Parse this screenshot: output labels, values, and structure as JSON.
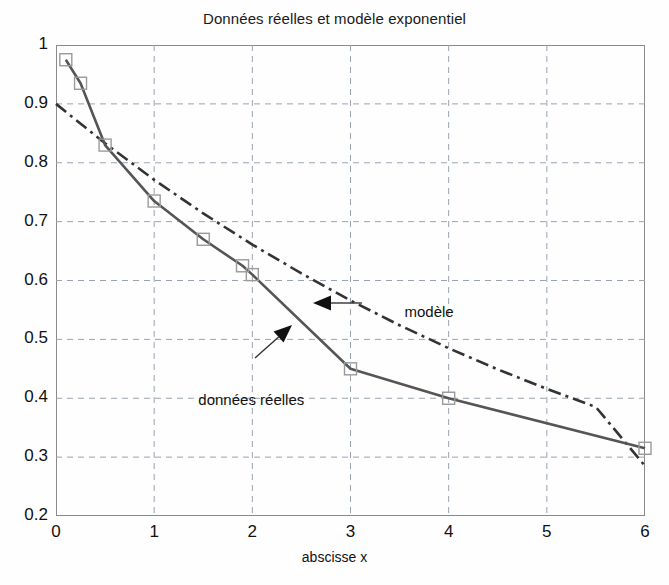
{
  "chart_data": {
    "type": "line",
    "title": "Données réelles et modèle exponentiel",
    "xlabel": "abscisse x",
    "ylabel": "",
    "xlim": [
      0,
      6
    ],
    "ylim": [
      0.2,
      1.0
    ],
    "xticks": [
      "0",
      "1",
      "2",
      "3",
      "4",
      "5",
      "6"
    ],
    "yticks": [
      "0.2",
      "0.3",
      "0.4",
      "0.5",
      "0.6",
      "0.7",
      "0.8",
      "0.9",
      "1"
    ],
    "grid": true,
    "grid_style": "dashed",
    "legend": "none",
    "series": [
      {
        "name": "données réelles",
        "style": "solid-line-with-square-markers",
        "color": "#555555",
        "marker": "square-open",
        "x": [
          0.1,
          0.25,
          0.5,
          1.0,
          1.5,
          1.9,
          2.0,
          3.0,
          4.0,
          6.0
        ],
        "y": [
          0.975,
          0.935,
          0.83,
          0.735,
          0.67,
          0.625,
          0.61,
          0.45,
          0.4,
          0.315
        ]
      },
      {
        "name": "modèle",
        "style": "dash-dot-line",
        "color": "#333333",
        "marker": "none",
        "x": [
          0.0,
          0.5,
          1.0,
          1.5,
          2.0,
          2.5,
          3.0,
          3.5,
          4.0,
          4.5,
          5.0,
          5.5,
          6.0
        ],
        "y": [
          0.9,
          0.833,
          0.771,
          0.714,
          0.661,
          0.612,
          0.566,
          0.524,
          0.485,
          0.449,
          0.416,
          0.385,
          0.285
        ]
      }
    ],
    "annotations": [
      {
        "text": "modèle",
        "x": 3.55,
        "y": 0.545
      },
      {
        "text": "données réelles",
        "x": 1.45,
        "y": 0.395
      }
    ]
  },
  "axis": {
    "x_tick_labels": [
      "0",
      "1",
      "2",
      "3",
      "4",
      "5",
      "6"
    ],
    "y_tick_labels": [
      "1",
      "0.9",
      "0.8",
      "0.7",
      "0.6",
      "0.5",
      "0.4",
      "0.3",
      "0.2"
    ],
    "x_axis_title": "abscisse x"
  },
  "header": {
    "title": "Données réelles et modèle exponentiel"
  },
  "annotations": {
    "model_label": "modèle",
    "data_label": "données réelles"
  },
  "colors": {
    "data_line": "#555555",
    "model_line": "#333333",
    "grid": "#9aa3b0",
    "axis": "#8a8a8a",
    "text": "#111111",
    "background": "#fefefe"
  }
}
